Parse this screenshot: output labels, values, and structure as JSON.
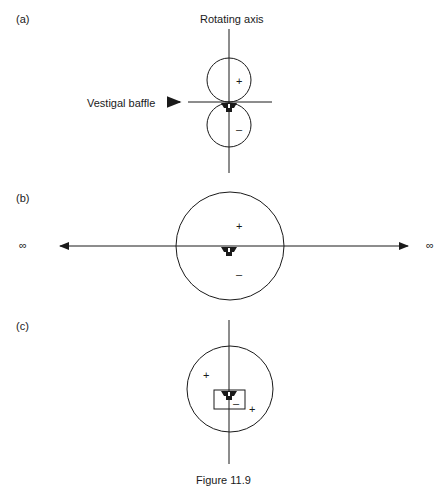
{
  "panels": [
    {
      "id": "a",
      "label": "(a)",
      "axis_label": "Rotating axis",
      "baffle_label": "Vestigal baffle",
      "signs": {
        "top": "+",
        "bottom": "–"
      }
    },
    {
      "id": "b",
      "label": "(b)",
      "infinity_left": "∞",
      "infinity_right": "∞",
      "signs": {
        "top": "+",
        "bottom": "–"
      }
    },
    {
      "id": "c",
      "label": "(c)",
      "signs": {
        "upper_left": "+",
        "inside_box": "–",
        "lower_right": "+"
      }
    }
  ],
  "caption": "Figure 11.9",
  "colors": {
    "stroke": "#1a1a1a",
    "background": "#ffffff"
  }
}
